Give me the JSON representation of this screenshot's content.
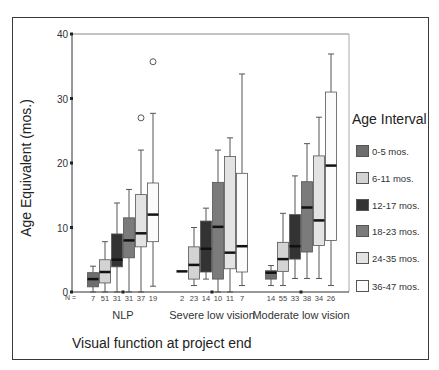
{
  "chart_data": {
    "type": "boxplot",
    "title": "",
    "xlabel": "Visual function at project end",
    "ylabel": "Age Equivalent (mos.)",
    "ylim": [
      0,
      40
    ],
    "yticks": [
      0,
      10,
      20,
      30,
      40
    ],
    "grid": false,
    "legend": {
      "title": "Age Interval",
      "position": "right",
      "entries": [
        {
          "label": "0-5 mos.",
          "color": "#6e6e6e"
        },
        {
          "label": "6-11 mos.",
          "color": "#d3d3d3"
        },
        {
          "label": "12-17 mos.",
          "color": "#333333"
        },
        {
          "label": "18-23 mos.",
          "color": "#7b7b7b"
        },
        {
          "label": "24-35 mos.",
          "color": "#e3e3e3"
        },
        {
          "label": "36-47 mos.",
          "color": "#fbfbfb"
        }
      ]
    },
    "n_prefix": "N =",
    "categories": [
      "NLP",
      "Severe low vision",
      "Moderate low vision"
    ],
    "groups": [
      {
        "name": "NLP",
        "boxes": [
          {
            "series": "0-5 mos.",
            "n": 7,
            "whisker_low": 0,
            "q1": 0.8,
            "median": 2.0,
            "q3": 3.0,
            "whisker_high": 4.0,
            "outliers": []
          },
          {
            "series": "6-11 mos.",
            "n": 51,
            "whisker_low": 0,
            "q1": 1.4,
            "median": 3.1,
            "q3": 5.0,
            "whisker_high": 7.8,
            "outliers": []
          },
          {
            "series": "12-17 mos.",
            "n": 31,
            "whisker_low": 0,
            "q1": 3.9,
            "median": 5.0,
            "q3": 9.0,
            "whisker_high": 13.8,
            "outliers": []
          },
          {
            "series": "18-23 mos.",
            "n": 31,
            "whisker_low": 0,
            "q1": 5.3,
            "median": 8.0,
            "q3": 11.5,
            "whisker_high": 15.9,
            "outliers": []
          },
          {
            "series": "24-35 mos.",
            "n": 37,
            "whisker_low": 0,
            "q1": 7.0,
            "median": 9.1,
            "q3": 15.1,
            "whisker_high": 22.0,
            "outliers": [
              27.0
            ]
          },
          {
            "series": "36-47 mos.",
            "n": 19,
            "whisker_low": 0.9,
            "q1": 7.8,
            "median": 12.0,
            "q3": 16.9,
            "whisker_high": 27.7,
            "outliers": [
              35.7
            ]
          }
        ]
      },
      {
        "name": "Severe low vision",
        "boxes": [
          {
            "series": "0-5 mos.",
            "n": 2,
            "whisker_low": 3.2,
            "q1": 3.2,
            "median": 3.2,
            "q3": 3.2,
            "whisker_high": 3.2,
            "outliers": []
          },
          {
            "series": "6-11 mos.",
            "n": 23,
            "whisker_low": 1.0,
            "q1": 2.0,
            "median": 4.2,
            "q3": 7.0,
            "whisker_high": 10.0,
            "outliers": []
          },
          {
            "series": "12-17 mos.",
            "n": 14,
            "whisker_low": 2.0,
            "q1": 3.1,
            "median": 6.7,
            "q3": 11.0,
            "whisker_high": 13.0,
            "outliers": []
          },
          {
            "series": "18-23 mos.",
            "n": 10,
            "whisker_low": 0,
            "q1": 2.0,
            "median": 10.1,
            "q3": 17.0,
            "whisker_high": 22.0,
            "outliers": []
          },
          {
            "series": "24-35 mos.",
            "n": 11,
            "whisker_low": 0,
            "q1": 3.6,
            "median": 6.1,
            "q3": 21.0,
            "whisker_high": 23.9,
            "outliers": []
          },
          {
            "series": "36-47 mos.",
            "n": 7,
            "whisker_low": 1.0,
            "q1": 3.1,
            "median": 7.1,
            "q3": 18.4,
            "whisker_high": 33.8,
            "outliers": []
          }
        ]
      },
      {
        "name": "Moderate low vision",
        "boxes": [
          {
            "series": "0-5 mos.",
            "n": 14,
            "whisker_low": 1.0,
            "q1": 2.0,
            "median": 3.0,
            "q3": 3.3,
            "whisker_high": 4.1,
            "outliers": []
          },
          {
            "series": "6-11 mos.",
            "n": 55,
            "whisker_low": 1.0,
            "q1": 3.2,
            "median": 5.1,
            "q3": 7.7,
            "whisker_high": 12.2,
            "outliers": []
          },
          {
            "series": "12-17 mos.",
            "n": 33,
            "whisker_low": 2.1,
            "q1": 5.1,
            "median": 7.1,
            "q3": 12.0,
            "whisker_high": 18.0,
            "outliers": []
          },
          {
            "series": "18-23 mos.",
            "n": 38,
            "whisker_low": 2.1,
            "q1": 6.2,
            "median": 13.1,
            "q3": 17.1,
            "whisker_high": 23.0,
            "outliers": []
          },
          {
            "series": "24-35 mos.",
            "n": 34,
            "whisker_low": 2.1,
            "q1": 7.2,
            "median": 11.1,
            "q3": 21.1,
            "whisker_high": 27.1,
            "outliers": []
          },
          {
            "series": "36-47 mos.",
            "n": 26,
            "whisker_low": 1.0,
            "q1": 8.0,
            "median": 19.6,
            "q3": 31.0,
            "whisker_high": 36.9,
            "outliers": []
          }
        ]
      }
    ]
  }
}
